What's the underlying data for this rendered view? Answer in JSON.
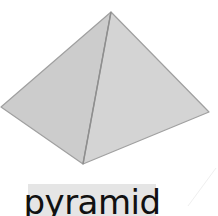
{
  "label": {
    "text": "pyramid"
  },
  "figure": {
    "shape": "square-pyramid",
    "vertices": {
      "apex": [
        111,
        12
      ],
      "left": [
        1,
        107
      ],
      "right": [
        209,
        112
      ],
      "bottom": [
        83,
        164
      ]
    },
    "colors": {
      "left_face": "#cccccc",
      "right_face": "#d4d4d4",
      "edge": "#9a9a9a",
      "label_bg": "#e5e5e5",
      "label_text": "#111111"
    }
  }
}
